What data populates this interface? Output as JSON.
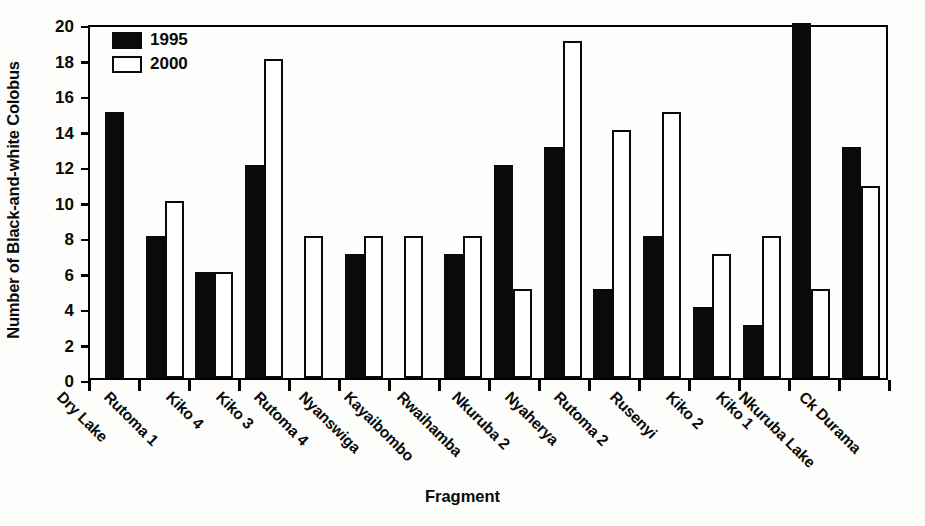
{
  "chart_data": {
    "type": "bar",
    "title": "",
    "xlabel": "Fragment",
    "ylabel": "Number of Black-and-white Colobus",
    "ylim": [
      0,
      20
    ],
    "ytick_step": 2,
    "yticks": [
      20,
      18,
      16,
      14,
      12,
      10,
      8,
      6,
      4,
      2,
      0
    ],
    "grid": false,
    "legend_position": "top-left",
    "categories": [
      "Dry Lake",
      "Rutoma 1",
      "Kiko 4",
      "Kiko 3",
      "Rutoma 4",
      "Nyanswiga",
      "Kayaibombo",
      "Rwaihamba",
      "Nkuruba 2",
      "Nyaherya",
      "Rutoma 2",
      "Rusenyi",
      "Kiko 2",
      "Kiko 1",
      "Nkuruba Lake",
      "Ck Durama"
    ],
    "series": [
      {
        "name": "1995",
        "color": "#0a0a0a",
        "style": "filled",
        "values": [
          15,
          8,
          6,
          12,
          0,
          7,
          0,
          7,
          12,
          13,
          5,
          8,
          4,
          3,
          20,
          13
        ]
      },
      {
        "name": "2000",
        "color": "#ffffff",
        "style": "outlined",
        "values": [
          0,
          10,
          6,
          18,
          8,
          8,
          8,
          8,
          5,
          19,
          14,
          15,
          7,
          8,
          5,
          10.8
        ]
      }
    ]
  },
  "axis": {
    "x_title": "Fragment",
    "y_title": "Number of Black-and-white Colobus"
  }
}
